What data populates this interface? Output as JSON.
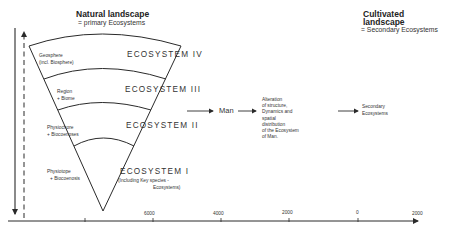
{
  "natural_landscape": {
    "title": "Natural landscape",
    "subtitle": "= primary Ecosystems"
  },
  "cultivated_landscape": {
    "title_line1": "Cultivated",
    "title_line2": "landscape",
    "subtitle": "= Secondary  Ecosystems"
  },
  "levels": [
    {
      "id": "IV",
      "label": "ECOSYSTEM  IV",
      "left_line1": "Geosphere",
      "left_line2": "(incl. Biosphere)"
    },
    {
      "id": "III",
      "label": "ECOSYSTEM  III",
      "left_line1": "Region",
      "left_line2": "+ Biome"
    },
    {
      "id": "II",
      "label": "ECOSYSTEM  II",
      "left_line1": "Physiochore",
      "left_line2": "+ Biocoenoses"
    },
    {
      "id": "I",
      "label": "ECOSYSTEM  I",
      "left_line1": "Physiotope",
      "left_line2": "+ Biocoenosis",
      "note_line1": "(Including Key species -",
      "note_line2": "Ecosystems)"
    }
  ],
  "flow": {
    "man_label": "Man",
    "alteration_lines": [
      "Alteration",
      "of structure,",
      "Dynamics and",
      "spatial",
      "distribution",
      "of the Ecosystem",
      "of Man."
    ],
    "secondary_line1": "Secondary",
    "secondary_line2": "Ecosystems"
  },
  "time_axis": {
    "ticks": [
      "",
      "6000",
      "4000",
      "2000",
      "0",
      "2000"
    ]
  },
  "colors": {
    "ink": "#2a2a2a",
    "background": "#ffffff"
  }
}
